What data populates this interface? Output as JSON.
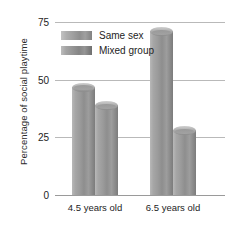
{
  "chart_data": {
    "type": "bar",
    "title": "",
    "xlabel": "",
    "ylabel": "Percentage of social playtime",
    "categories": [
      "4.5 years old",
      "6.5 years old"
    ],
    "series": [
      {
        "name": "Same sex",
        "values": [
          47,
          71
        ]
      },
      {
        "name": "Mixed group",
        "values": [
          39,
          28
        ]
      }
    ],
    "ylim": [
      0,
      75
    ],
    "yticks": [
      "0",
      "25",
      "50",
      "75"
    ],
    "ytick_values": [
      0,
      25,
      50,
      75
    ],
    "grid": true,
    "legend_position": "top-left",
    "colors": {
      "same_sex": "#9b9b9b",
      "mixed_group": "#8a8a8a",
      "gridline": "#b9b9b9",
      "axis": "#9a9a9a",
      "text": "#1d1d1d",
      "background": "#ffffff"
    }
  },
  "axes": {
    "y_title": "Percentage of social playtime",
    "y_ticks": [
      {
        "label": "75",
        "value": 75
      },
      {
        "label": "50",
        "value": 50
      },
      {
        "label": "25",
        "value": 25
      },
      {
        "label": "0",
        "value": 0
      }
    ],
    "x_ticks": [
      {
        "label": "4.5 years old"
      },
      {
        "label": "6.5 years old"
      }
    ]
  },
  "legend": {
    "entries": [
      {
        "label": "Same sex",
        "key": "same_sex"
      },
      {
        "label": "Mixed group",
        "key": "mixed_group"
      }
    ]
  },
  "bars": [
    {
      "name": "bar-4.5-same-sex",
      "group": 0,
      "series": 0,
      "value": 47
    },
    {
      "name": "bar-4.5-mixed-group",
      "group": 0,
      "series": 1,
      "value": 39
    },
    {
      "name": "bar-6.5-same-sex",
      "group": 1,
      "series": 0,
      "value": 71
    },
    {
      "name": "bar-6.5-mixed-group",
      "group": 1,
      "series": 1,
      "value": 28
    }
  ]
}
